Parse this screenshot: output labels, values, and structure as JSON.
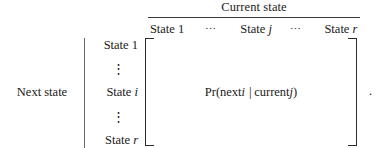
{
  "figure": {
    "kind": "transition-probability-matrix",
    "trailing_punctuation": "."
  },
  "columns": {
    "group_label": "Current state",
    "headers": [
      {
        "text": "State 1",
        "italic_part": "",
        "kind": "label",
        "center_x_pct": 9
      },
      {
        "text": "⋯",
        "kind": "ellipsis",
        "center_x_pct": 30
      },
      {
        "text": "State ",
        "italic_part": "j",
        "kind": "label",
        "center_x_pct": 51
      },
      {
        "text": "⋯",
        "kind": "ellipsis",
        "center_x_pct": 70
      },
      {
        "text": "State ",
        "italic_part": "r",
        "kind": "label",
        "center_x_pct": 91
      }
    ]
  },
  "rows": {
    "group_label": "Next state",
    "headers": [
      {
        "text": "State 1",
        "italic_part": "",
        "kind": "label",
        "top": 0
      },
      {
        "text": "⋮",
        "kind": "vertical-ellipsis",
        "top": 24
      },
      {
        "text": "State ",
        "italic_part": "i",
        "kind": "label",
        "top": 47
      },
      {
        "text": "⋮",
        "kind": "vertical-ellipsis",
        "top": 72
      },
      {
        "text": "State ",
        "italic_part": "r",
        "kind": "label",
        "top": 95
      }
    ]
  },
  "matrix": {
    "left_bracket": "[",
    "right_bracket": "]",
    "entry": {
      "function_name": "Pr",
      "open_paren": "(",
      "condition_event": "next ",
      "event_index": "i",
      "separator": "|",
      "given_event": "current ",
      "given_index": "j",
      "close_paren": ")"
    }
  },
  "colors": {
    "ink": "#1a1a1a",
    "rule": "#3a3a3a",
    "bracket": "#2b2b2b",
    "background": "#ffffff"
  }
}
